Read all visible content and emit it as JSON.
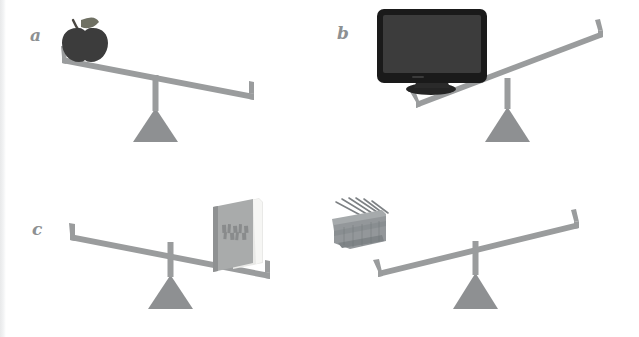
{
  "figure": {
    "kind": "illustration",
    "background_color": "#ffffff",
    "beam_color": "#9a9c9d",
    "fulcrum_color": "#8e9092",
    "label_color": "#8d9092"
  },
  "panels": [
    {
      "id": "a",
      "label": "a",
      "object_name": "apple",
      "object_icon": "apple-icon",
      "object_side": "left",
      "tilt": "down-left",
      "tilt_degrees": -11,
      "object_colors": {
        "body": "#3c3c3c",
        "stem": "#4a4742",
        "leaf": "#6f7063"
      }
    },
    {
      "id": "b",
      "label": "b",
      "object_name": "monitor",
      "object_icon": "monitor-icon",
      "object_side": "left",
      "tilt": "down-left",
      "tilt_degrees": -17,
      "object_colors": {
        "bezel": "#1a1a1a",
        "screen": "#3a3a3a",
        "stand": "#242424"
      }
    },
    {
      "id": "c",
      "label": "c",
      "object_name": "book",
      "object_icon": "book-icon",
      "object_side": "right",
      "tilt": "down-right",
      "tilt_degrees": 11,
      "object_colors": {
        "cover": "#a9abab",
        "spine": "#8f9192",
        "pages": "#f4f4f2"
      }
    },
    {
      "id": "d",
      "label": "d",
      "object_name": "basket-of-tools",
      "object_icon": "basket-icon",
      "object_side": "left",
      "tilt": "down-left",
      "tilt_degrees": -11,
      "object_colors": {
        "body": "#93979a",
        "rim": "#a6aaac",
        "sticks": "#7d8184"
      }
    }
  ]
}
